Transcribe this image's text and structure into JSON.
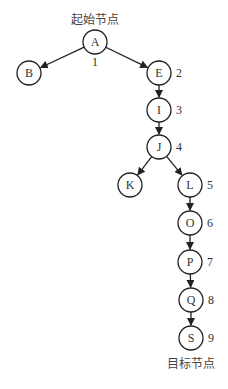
{
  "diagram": {
    "type": "search-tree",
    "start_label": "起始节点",
    "goal_label": "目标节点",
    "nodes": [
      {
        "id": "A",
        "label": "A",
        "order": "1",
        "x": 95,
        "y": 42
      },
      {
        "id": "B",
        "label": "B",
        "order": "",
        "x": 29,
        "y": 73
      },
      {
        "id": "E",
        "label": "E",
        "order": "2",
        "x": 159,
        "y": 73
      },
      {
        "id": "I",
        "label": "I",
        "order": "3",
        "x": 159,
        "y": 110
      },
      {
        "id": "J",
        "label": "J",
        "order": "4",
        "x": 159,
        "y": 147
      },
      {
        "id": "K",
        "label": "K",
        "order": "",
        "x": 130,
        "y": 185
      },
      {
        "id": "L",
        "label": "L",
        "order": "5",
        "x": 190,
        "y": 185
      },
      {
        "id": "O",
        "label": "O",
        "order": "6",
        "x": 190,
        "y": 223
      },
      {
        "id": "P",
        "label": "P",
        "order": "7",
        "x": 190,
        "y": 262
      },
      {
        "id": "Q",
        "label": "Q",
        "order": "8",
        "x": 191,
        "y": 300
      },
      {
        "id": "S",
        "label": "S",
        "order": "9",
        "x": 191,
        "y": 338
      }
    ],
    "edges": [
      [
        "A",
        "B"
      ],
      [
        "A",
        "E"
      ],
      [
        "E",
        "I"
      ],
      [
        "I",
        "J"
      ],
      [
        "J",
        "K"
      ],
      [
        "J",
        "L"
      ],
      [
        "L",
        "O"
      ],
      [
        "O",
        "P"
      ],
      [
        "P",
        "Q"
      ],
      [
        "Q",
        "S"
      ]
    ],
    "colors": {
      "stroke": "#222222",
      "text": "#333333",
      "background": "#ffffff"
    }
  }
}
